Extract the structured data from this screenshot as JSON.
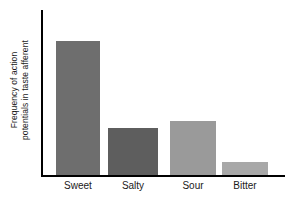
{
  "chart_data": {
    "type": "bar",
    "title": "",
    "subtitle": "",
    "xlabel": "",
    "ylabel": "Frequency of action potentials in taste afferent",
    "ylabel_lines": [
      "Frequency of action",
      "potentials in taste afferent"
    ],
    "categories": [
      "Sweet",
      "Salty",
      "Sour",
      "Bitter"
    ],
    "values": [
      100,
      35,
      40,
      10
    ],
    "ylim": [
      0,
      123
    ],
    "grid": false,
    "legend": null,
    "tick_labels_y": [],
    "annotations": [],
    "bars": [
      {
        "category": "Sweet",
        "value": 100,
        "color": "#6e6e6e",
        "left_px": 56,
        "width_px": 44,
        "height_px": 134
      },
      {
        "category": "Salty",
        "value": 35,
        "color": "#5e5e5e",
        "left_px": 108,
        "width_px": 50,
        "height_px": 47
      },
      {
        "category": "Sour",
        "value": 40,
        "color": "#9a9a9a",
        "left_px": 170,
        "width_px": 46,
        "height_px": 54
      },
      {
        "category": "Bitter",
        "value": 10,
        "color": "#a8a8a8",
        "left_px": 222,
        "width_px": 46,
        "height_px": 13
      }
    ],
    "colors": {
      "axis": "#000000",
      "text": "#1a1a1a",
      "background": "#ffffff",
      "sweet": "#6e6e6e",
      "salty": "#5e5e5e",
      "sour": "#9a9a9a",
      "bitter": "#a8a8a8"
    }
  }
}
